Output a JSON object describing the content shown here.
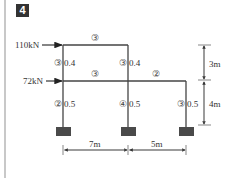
{
  "problem_number": "4",
  "loads": [
    {
      "label": "110kN",
      "level": "top"
    },
    {
      "label": "72kN",
      "level": "middle"
    }
  ],
  "beams": [
    {
      "id": "top-beam",
      "stiffness_mark": "③"
    },
    {
      "id": "mid-beam-left",
      "stiffness_mark": "③"
    },
    {
      "id": "mid-beam-right",
      "stiffness_mark": "②"
    }
  ],
  "columns": [
    {
      "id": "upper-left",
      "mark": "③",
      "ratio": "0.4"
    },
    {
      "id": "upper-middle",
      "mark": "③",
      "ratio": "0.4"
    },
    {
      "id": "lower-left",
      "mark": "②",
      "ratio": "0.5"
    },
    {
      "id": "lower-middle",
      "mark": "④",
      "ratio": "0.5"
    },
    {
      "id": "lower-right",
      "mark": "③",
      "ratio": "0.5"
    }
  ],
  "dimensions": {
    "span_left": "7m",
    "span_right": "5m",
    "height_upper": "3m",
    "height_lower": "4m"
  },
  "colors": {
    "line": "#444444",
    "support": "#4a4a4a",
    "badge": "#333333"
  }
}
